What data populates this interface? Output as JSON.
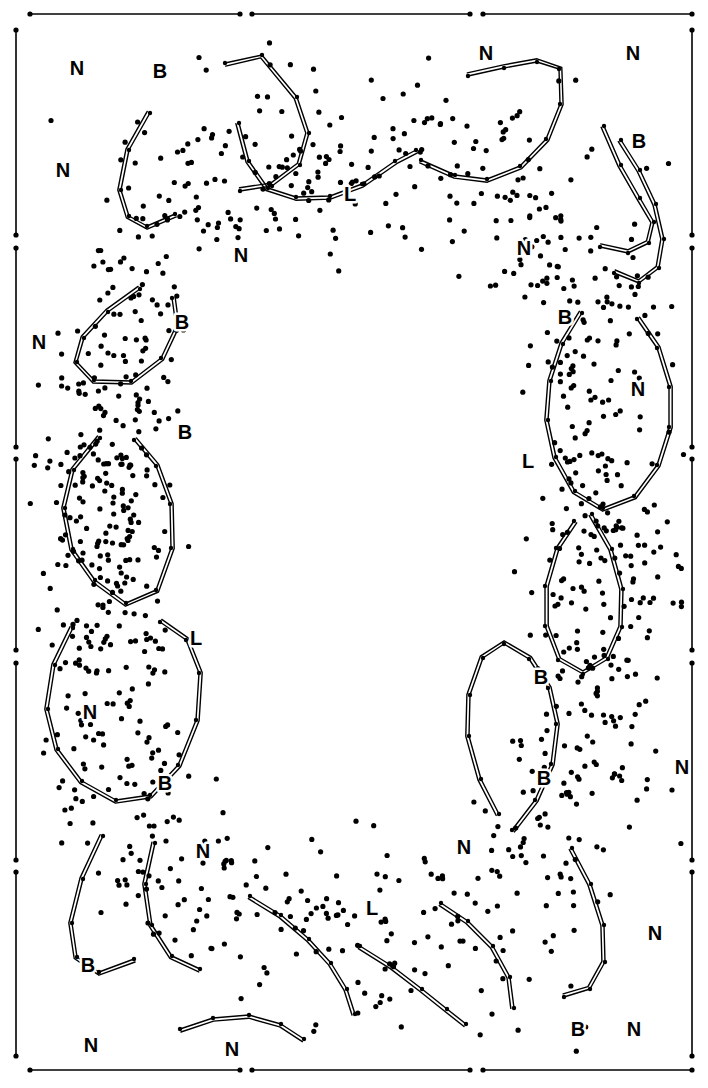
{
  "figure": {
    "kind": "scientific-diagram",
    "width": 708,
    "height": 1088,
    "background_color": "#ffffff",
    "ink_color": "#000000",
    "dot_radius": 2.6,
    "chain_stroke_width": 1.4,
    "chain_offset": 3.2,
    "vertex_radius": 2.2
  },
  "frame": {
    "stroke_color": "#000000",
    "stroke_width": 1.6,
    "endpoint_dot_radius": 2.6,
    "top_segments": [
      {
        "x1": 30,
        "x2": 240,
        "y": 14
      },
      {
        "x1": 252,
        "x2": 470,
        "y": 14
      },
      {
        "x1": 483,
        "x2": 692,
        "y": 14
      }
    ],
    "bottom_segments": [
      {
        "x1": 30,
        "x2": 240,
        "y": 1070
      },
      {
        "x1": 252,
        "x2": 470,
        "y": 1070
      },
      {
        "x1": 483,
        "x2": 692,
        "y": 1070
      }
    ],
    "left_segments": [
      {
        "y1": 30,
        "y2": 235,
        "x": 16
      },
      {
        "y1": 248,
        "y2": 447,
        "x": 16
      },
      {
        "y1": 459,
        "y2": 650,
        "x": 16
      },
      {
        "y1": 663,
        "y2": 860,
        "x": 16
      },
      {
        "y1": 872,
        "y2": 1056,
        "x": 16
      }
    ],
    "right_segments": [
      {
        "y1": 30,
        "y2": 235,
        "x": 692
      },
      {
        "y1": 248,
        "y2": 447,
        "x": 692
      },
      {
        "y1": 459,
        "y2": 650,
        "x": 692
      },
      {
        "y1": 663,
        "y2": 860,
        "x": 692
      },
      {
        "y1": 872,
        "y2": 1056,
        "x": 692
      }
    ]
  },
  "labels": [
    {
      "text": "N",
      "x": 77,
      "y": 70
    },
    {
      "text": "B",
      "x": 160,
      "y": 73
    },
    {
      "text": "N",
      "x": 486,
      "y": 55
    },
    {
      "text": "N",
      "x": 633,
      "y": 55
    },
    {
      "text": "N",
      "x": 63,
      "y": 172
    },
    {
      "text": "B",
      "x": 639,
      "y": 143
    },
    {
      "text": "N",
      "x": 241,
      "y": 257
    },
    {
      "text": "N",
      "x": 524,
      "y": 250
    },
    {
      "text": "L",
      "x": 350,
      "y": 196
    },
    {
      "text": "N",
      "x": 39,
      "y": 344
    },
    {
      "text": "B",
      "x": 182,
      "y": 324
    },
    {
      "text": "B",
      "x": 565,
      "y": 319
    },
    {
      "text": "N",
      "x": 638,
      "y": 391
    },
    {
      "text": "B",
      "x": 185,
      "y": 434
    },
    {
      "text": "L",
      "x": 528,
      "y": 463
    },
    {
      "text": "L",
      "x": 196,
      "y": 640
    },
    {
      "text": "N",
      "x": 90,
      "y": 714
    },
    {
      "text": "B",
      "x": 541,
      "y": 679
    },
    {
      "text": "B",
      "x": 165,
      "y": 785
    },
    {
      "text": "B",
      "x": 544,
      "y": 780
    },
    {
      "text": "N",
      "x": 682,
      "y": 769
    },
    {
      "text": "N",
      "x": 203,
      "y": 853
    },
    {
      "text": "N",
      "x": 464,
      "y": 849
    },
    {
      "text": "L",
      "x": 372,
      "y": 910
    },
    {
      "text": "B",
      "x": 88,
      "y": 967
    },
    {
      "text": "N",
      "x": 655,
      "y": 935
    },
    {
      "text": "N",
      "x": 91,
      "y": 1047
    },
    {
      "text": "B",
      "x": 578,
      "y": 1031
    },
    {
      "text": "N",
      "x": 634,
      "y": 1031
    },
    {
      "text": "N",
      "x": 232,
      "y": 1051
    }
  ],
  "chains": [
    {
      "id": "chain-top-left-a",
      "points": [
        [
          225,
          63
        ],
        [
          262,
          55
        ],
        [
          297,
          97
        ],
        [
          309,
          133
        ],
        [
          300,
          165
        ],
        [
          272,
          186
        ],
        [
          240,
          191
        ]
      ]
    },
    {
      "id": "chain-top-left-b",
      "points": [
        [
          150,
          113
        ],
        [
          129,
          150
        ],
        [
          121,
          190
        ],
        [
          129,
          216
        ],
        [
          147,
          226
        ],
        [
          175,
          214
        ]
      ]
    },
    {
      "id": "chain-top-mid",
      "points": [
        [
          239,
          123
        ],
        [
          249,
          161
        ],
        [
          268,
          188
        ],
        [
          296,
          197
        ],
        [
          330,
          196
        ],
        [
          362,
          184
        ],
        [
          395,
          161
        ],
        [
          416,
          150
        ]
      ]
    },
    {
      "id": "chain-top-right-a",
      "points": [
        [
          421,
          160
        ],
        [
          455,
          175
        ],
        [
          487,
          179
        ],
        [
          520,
          166
        ],
        [
          546,
          139
        ],
        [
          560,
          104
        ],
        [
          559,
          69
        ],
        [
          537,
          62
        ],
        [
          504,
          68
        ],
        [
          468,
          76
        ]
      ]
    },
    {
      "id": "chain-top-right-b",
      "points": [
        [
          604,
          126
        ],
        [
          621,
          165
        ],
        [
          640,
          198
        ],
        [
          654,
          222
        ],
        [
          649,
          243
        ],
        [
          628,
          253
        ],
        [
          600,
          247
        ]
      ]
    },
    {
      "id": "chain-left-upper",
      "points": [
        [
          140,
          289
        ],
        [
          108,
          312
        ],
        [
          84,
          338
        ],
        [
          77,
          362
        ],
        [
          94,
          380
        ],
        [
          131,
          381
        ],
        [
          161,
          358
        ],
        [
          176,
          326
        ],
        [
          172,
          298
        ]
      ]
    },
    {
      "id": "chain-left-mid",
      "points": [
        [
          100,
          438
        ],
        [
          74,
          470
        ],
        [
          65,
          508
        ],
        [
          73,
          549
        ],
        [
          95,
          580
        ],
        [
          126,
          603
        ],
        [
          156,
          590
        ],
        [
          171,
          548
        ],
        [
          170,
          504
        ],
        [
          156,
          466
        ],
        [
          134,
          440
        ]
      ]
    },
    {
      "id": "chain-left-lower",
      "points": [
        [
          73,
          628
        ],
        [
          55,
          665
        ],
        [
          48,
          709
        ],
        [
          58,
          749
        ],
        [
          82,
          781
        ],
        [
          116,
          800
        ],
        [
          150,
          795
        ],
        [
          178,
          765
        ],
        [
          196,
          720
        ],
        [
          199,
          673
        ],
        [
          186,
          640
        ],
        [
          160,
          622
        ]
      ]
    },
    {
      "id": "chain-left-bottom-a",
      "points": [
        [
          103,
          836
        ],
        [
          83,
          879
        ],
        [
          72,
          923
        ],
        [
          77,
          957
        ],
        [
          99,
          972
        ],
        [
          134,
          959
        ]
      ]
    },
    {
      "id": "chain-left-bottom-b",
      "points": [
        [
          155,
          843
        ],
        [
          146,
          884
        ],
        [
          152,
          925
        ],
        [
          172,
          956
        ],
        [
          200,
          969
        ]
      ]
    },
    {
      "id": "chain-bottom-mid-a",
      "points": [
        [
          180,
          1029
        ],
        [
          213,
          1018
        ],
        [
          249,
          1015
        ],
        [
          281,
          1024
        ],
        [
          304,
          1039
        ]
      ]
    },
    {
      "id": "chain-bottom-mid-b",
      "points": [
        [
          250,
          896
        ],
        [
          281,
          915
        ],
        [
          309,
          939
        ],
        [
          331,
          963
        ],
        [
          347,
          989
        ],
        [
          355,
          1014
        ]
      ]
    },
    {
      "id": "chain-bottom-right-a",
      "points": [
        [
          360,
          946
        ],
        [
          392,
          966
        ],
        [
          422,
          989
        ],
        [
          447,
          1009
        ],
        [
          466,
          1024
        ]
      ]
    },
    {
      "id": "chain-bottom-right-b",
      "points": [
        [
          441,
          903
        ],
        [
          468,
          921
        ],
        [
          493,
          946
        ],
        [
          510,
          977
        ],
        [
          514,
          1008
        ]
      ]
    },
    {
      "id": "chain-right-bottom",
      "points": [
        [
          572,
          848
        ],
        [
          591,
          884
        ],
        [
          604,
          925
        ],
        [
          605,
          962
        ],
        [
          590,
          989
        ],
        [
          564,
          997
        ]
      ]
    },
    {
      "id": "chain-right-lower",
      "points": [
        [
          512,
          830
        ],
        [
          535,
          800
        ],
        [
          551,
          764
        ],
        [
          556,
          724
        ],
        [
          548,
          688
        ],
        [
          529,
          659
        ],
        [
          504,
          644
        ],
        [
          483,
          658
        ],
        [
          470,
          695
        ],
        [
          469,
          736
        ],
        [
          481,
          779
        ],
        [
          499,
          814
        ]
      ]
    },
    {
      "id": "chain-right-mid",
      "points": [
        [
          592,
          514
        ],
        [
          612,
          549
        ],
        [
          623,
          589
        ],
        [
          622,
          627
        ],
        [
          608,
          659
        ],
        [
          583,
          674
        ],
        [
          558,
          660
        ],
        [
          545,
          626
        ],
        [
          545,
          586
        ],
        [
          556,
          548
        ],
        [
          574,
          521
        ]
      ]
    },
    {
      "id": "chain-right-upper",
      "points": [
        [
          582,
          313
        ],
        [
          563,
          344
        ],
        [
          551,
          381
        ],
        [
          548,
          420
        ],
        [
          556,
          457
        ],
        [
          575,
          491
        ],
        [
          603,
          508
        ],
        [
          634,
          496
        ],
        [
          657,
          465
        ],
        [
          669,
          427
        ],
        [
          669,
          387
        ],
        [
          657,
          348
        ],
        [
          637,
          319
        ]
      ]
    },
    {
      "id": "chain-right-top",
      "points": [
        [
          621,
          140
        ],
        [
          640,
          170
        ],
        [
          656,
          204
        ],
        [
          664,
          239
        ],
        [
          659,
          268
        ],
        [
          639,
          283
        ],
        [
          614,
          273
        ]
      ]
    }
  ],
  "dot_clusters": [
    {
      "name": "annulus",
      "note": "points form a closed ring; interior void is empty"
    }
  ]
}
